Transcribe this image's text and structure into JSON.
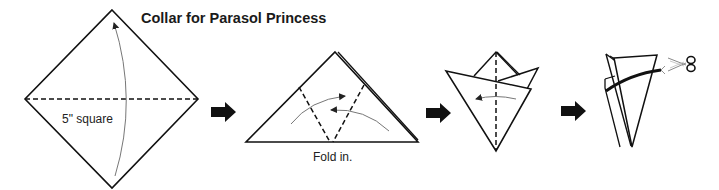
{
  "title": "Collar for Parasol Princess",
  "steps": [
    {
      "id": 1,
      "label": "5\" square",
      "description": "Square paper oriented as diamond, fold bottom corner up to top along horizontal dashed diagonal"
    },
    {
      "id": 2,
      "label": "Fold in.",
      "description": "Triangle with two dashed fold lines; fold both sides inward"
    },
    {
      "id": 3,
      "label": "",
      "description": "Folded shape with vertical dashed line; fold left"
    },
    {
      "id": 4,
      "label": "",
      "description": "Cut along curved line with scissors"
    }
  ],
  "icons": {
    "step_arrow": "right-arrow",
    "cut_tool": "scissors"
  },
  "colors": {
    "line": "#111111",
    "arrow_thin": "#777777",
    "background": "#ffffff"
  }
}
